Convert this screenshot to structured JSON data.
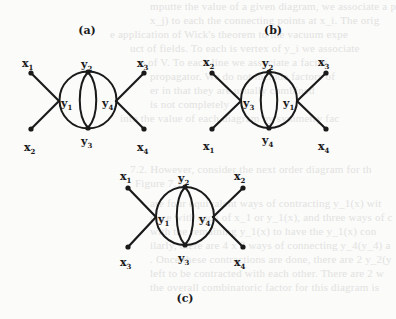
{
  "figure": {
    "line_color": "#1a1a1a",
    "background_color": "#fbfbfa",
    "bleed_color": "#e2e2e0",
    "panels": [
      {
        "id": "a",
        "label": "(a)",
        "vertices": {
          "left": "y1",
          "top": "y2",
          "bottom": "y3",
          "right": "y4"
        },
        "externals": {
          "top_left": "x1",
          "bottom_left": "x2",
          "top_right": "x3",
          "bottom_right": "x4"
        },
        "left_vertex": {
          "name": "y",
          "sub": "1"
        },
        "top_vertex": {
          "name": "y",
          "sub": "2"
        },
        "bottom_vertex": {
          "name": "y",
          "sub": "3"
        },
        "right_vertex": {
          "name": "y",
          "sub": "4"
        },
        "tl": {
          "name": "x",
          "sub": "1"
        },
        "bl": {
          "name": "x",
          "sub": "2"
        },
        "tr": {
          "name": "x",
          "sub": "3"
        },
        "br": {
          "name": "x",
          "sub": "4"
        }
      },
      {
        "id": "b",
        "label": "(b)",
        "vertices": {
          "left": "y3",
          "top": "y2",
          "bottom": "y4",
          "right": "y1"
        },
        "externals": {
          "top_left": "x2",
          "bottom_left": "x1",
          "top_right": "x3",
          "bottom_right": "x4"
        },
        "left_vertex": {
          "name": "y",
          "sub": "3"
        },
        "top_vertex": {
          "name": "y",
          "sub": "2"
        },
        "bottom_vertex": {
          "name": "y",
          "sub": "4"
        },
        "right_vertex": {
          "name": "y",
          "sub": "1"
        },
        "tl": {
          "name": "x",
          "sub": "2"
        },
        "bl": {
          "name": "x",
          "sub": "1"
        },
        "tr": {
          "name": "x",
          "sub": "3"
        },
        "br": {
          "name": "x",
          "sub": "4"
        }
      },
      {
        "id": "c",
        "label": "(c)",
        "vertices": {
          "left": "y1",
          "top": "y2",
          "bottom": "y3",
          "right": "y4"
        },
        "externals": {
          "top_left": "x1",
          "bottom_left": "x3",
          "top_right": "x2",
          "bottom_right": "x4"
        },
        "left_vertex": {
          "name": "y",
          "sub": "1"
        },
        "top_vertex": {
          "name": "y",
          "sub": "2"
        },
        "bottom_vertex": {
          "name": "y",
          "sub": "3"
        },
        "right_vertex": {
          "name": "y",
          "sub": "4"
        },
        "tl": {
          "name": "x",
          "sub": "1"
        },
        "bl": {
          "name": "x",
          "sub": "3"
        },
        "tr": {
          "name": "x",
          "sub": "2"
        },
        "br": {
          "name": "x",
          "sub": "4"
        }
      }
    ]
  },
  "bleed_through": [
    "mputte the value of a given diagram, we associate a p",
    "x_j) to each the connecting points at x_i. The orig",
    "e application of Wick's theorem to the vacuum expe",
    "uct of fields. To each is vertex of y_i we associate",
    "e of V. To each line we associate a factor",
    "propagator. We do not include factors of",
    "er in that they are usually combined",
    "is not completely",
    "into the value of each diagram by symmetry fac",
    "7.2. However, consider the next order diagram for th",
    "Figure 7.1.",
    "are four equivalent ways of contracting y_1(x) wit",
    "once with each of x_1 or y_1(x), and three ways of c",
    "with the remaining y_1(x) to have the y_1(x) con",
    "ilarly, there are 4 x 3 ways of connecting y_4(y_4) a",
    ". Once these contractions are done, there are 2 y_2(y",
    "left to be contracted with each other. There are 2 w",
    "the overall combinatoric factor for this diagram is"
  ]
}
